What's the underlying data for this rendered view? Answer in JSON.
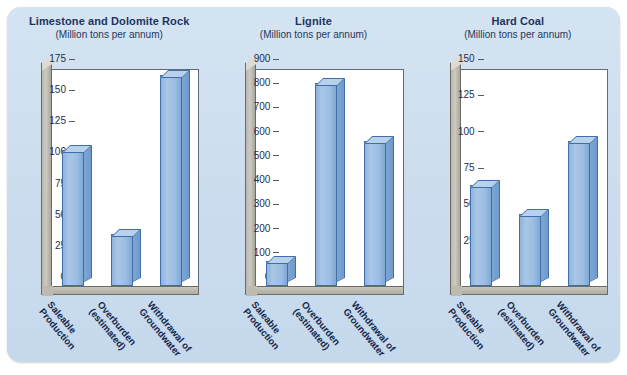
{
  "figure": {
    "units_note": "(Million tons per annum)",
    "categories": [
      "Saleable Production",
      "Overburden (estimated)",
      "Withdrawal of Groundwater"
    ],
    "category_lines": [
      [
        "Saleable",
        "Production"
      ],
      [
        "Overburden",
        "(estimated)"
      ],
      [
        "Withdrawal of",
        "Groundwater"
      ]
    ],
    "colors": {
      "panel_background": "#cfe0f0",
      "bar_face": "#9cbde1",
      "bar_top": "#b9d2ec",
      "bar_side": "#7ba5d4",
      "bar_outline": "#3f6ea8",
      "title": "#1c3461",
      "plot_background": "#ffffff",
      "wall": "#c3c0b8"
    }
  },
  "chart_data": [
    {
      "type": "bar",
      "title": "Limestone and Dolomite Rock",
      "subtitle": "(Million tons per annum)",
      "xlabel": "",
      "ylabel": "",
      "categories": [
        "Saleable Production",
        "Overburden (estimated)",
        "Withdrawal of Groundwater"
      ],
      "values": [
        110,
        42,
        170
      ],
      "ylim": [
        0,
        175
      ],
      "yticks": [
        0,
        25,
        50,
        75,
        100,
        125,
        150,
        175
      ],
      "ytick_labels": [
        "0",
        "25",
        "50",
        "75",
        "100",
        "125",
        "150",
        "175"
      ],
      "grid": false,
      "legend": "none"
    },
    {
      "type": "bar",
      "title": "Lignite",
      "subtitle": "(Million tons per annum)",
      "xlabel": "",
      "ylabel": "",
      "categories": [
        "Saleable Production",
        "Overburden (estimated)",
        "Withdrawal of Groundwater"
      ],
      "values": [
        105,
        840,
        600
      ],
      "ylim": [
        0,
        900
      ],
      "yticks": [
        0,
        100,
        200,
        300,
        400,
        500,
        600,
        700,
        800,
        900
      ],
      "ytick_labels": [
        "0",
        "100",
        "200",
        "300",
        "400",
        "500",
        "600",
        "700",
        "800",
        "900"
      ],
      "grid": false,
      "legend": "none"
    },
    {
      "type": "bar",
      "title": "Hard Coal",
      "subtitle": "(Million tons per annum)",
      "xlabel": "",
      "ylabel": "",
      "categories": [
        "Saleable Production",
        "Overburden (estimated)",
        "Withdrawal of Groundwater"
      ],
      "values": [
        70,
        50,
        100
      ],
      "ylim": [
        0,
        150
      ],
      "yticks": [
        0,
        25,
        50,
        75,
        100,
        125,
        150
      ],
      "ytick_labels": [
        "0",
        "25",
        "50",
        "75",
        "100",
        "125",
        "150"
      ],
      "grid": false,
      "legend": "none"
    }
  ]
}
